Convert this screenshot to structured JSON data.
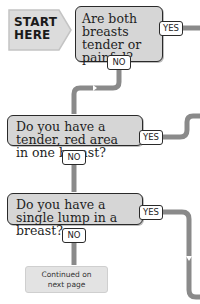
{
  "start": {
    "label": "START HERE"
  },
  "questions": [
    {
      "text": "Are both breasts tender or painful?",
      "yes_label": "YES",
      "no_label": "NO"
    },
    {
      "text": "Do you have a tender, red area in one breast?",
      "yes_label": "YES",
      "no_label": "NO"
    },
    {
      "text": "Do you have a single lump in a breast?",
      "yes_label": "YES",
      "no_label": "NO"
    }
  ],
  "continuation": {
    "label": "Continued on next page"
  },
  "colors": {
    "box_fill": "#d6d6d6",
    "box_border": "#2a2a2a",
    "connector": "#8a8a8a",
    "start_fill": "#dcdcdc",
    "continuation_fill": "#e3e3e3"
  }
}
